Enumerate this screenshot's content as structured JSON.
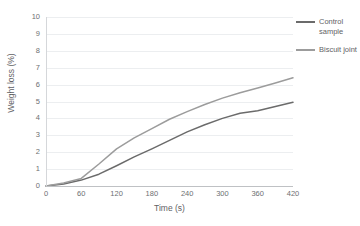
{
  "chart_data": {
    "type": "line",
    "title": "",
    "xlabel": "Time (s)",
    "ylabel": "Weight loss (%)",
    "xlim": [
      0,
      420
    ],
    "ylim": [
      0,
      10
    ],
    "xticks": [
      0,
      60,
      120,
      180,
      240,
      300,
      360,
      420
    ],
    "yticks": [
      0,
      1,
      2,
      3,
      4,
      5,
      6,
      7,
      8,
      9,
      10
    ],
    "grid": "horizontal",
    "legend_position": "right",
    "x": [
      0,
      30,
      60,
      90,
      120,
      150,
      180,
      210,
      240,
      270,
      300,
      330,
      360,
      390,
      420
    ],
    "series": [
      {
        "name": "Control sample",
        "color": "#6b6b6b",
        "values": [
          0,
          0.12,
          0.35,
          0.7,
          1.2,
          1.72,
          2.2,
          2.7,
          3.2,
          3.62,
          4.0,
          4.3,
          4.45,
          4.7,
          4.95
        ]
      },
      {
        "name": "Biscuit joint",
        "color": "#9c9c9c",
        "values": [
          0,
          0.18,
          0.45,
          1.3,
          2.2,
          2.85,
          3.4,
          3.95,
          4.4,
          4.82,
          5.2,
          5.52,
          5.8,
          6.1,
          6.4
        ]
      }
    ]
  },
  "axes": {
    "y_title": "Weight loss (%)",
    "x_title": "Time (s)",
    "y_ticks": [
      "0",
      "1",
      "2",
      "3",
      "4",
      "5",
      "6",
      "7",
      "8",
      "9",
      "10"
    ],
    "x_ticks": [
      "0",
      "60",
      "120",
      "180",
      "240",
      "300",
      "360",
      "420"
    ]
  },
  "legend": {
    "entries": [
      {
        "label": "Control sample",
        "color": "#6b6b6b"
      },
      {
        "label": "Biscuit joint",
        "color": "#9c9c9c"
      }
    ]
  }
}
